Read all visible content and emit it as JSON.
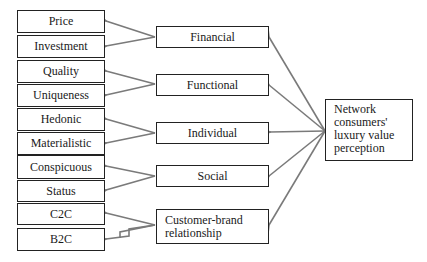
{
  "diagram": {
    "root": {
      "label": "Network consumers' luxury value perception",
      "lines": [
        "Network",
        "consumers'",
        "luxury value",
        "perception"
      ]
    },
    "dimensions": [
      {
        "label": "Financial",
        "children": [
          "Price",
          "Investment"
        ]
      },
      {
        "label": "Functional",
        "children": [
          "Quality",
          "Uniqueness"
        ]
      },
      {
        "label": "Individual",
        "children": [
          "Hedonic",
          "Materialistic"
        ]
      },
      {
        "label": "Social",
        "children": [
          "Conspicuous",
          "Status"
        ]
      },
      {
        "label": "Customer-brand relationship",
        "lines": [
          "Customer-brand",
          "relationship"
        ],
        "children": [
          "C2C",
          "B2C"
        ]
      }
    ],
    "leaves": [
      "Price",
      "Investment",
      "Quality",
      "Uniqueness",
      "Hedonic",
      "Materialistic",
      "Conspicuous",
      "Status",
      "C2C",
      "B2C"
    ]
  },
  "colors": {
    "arrow": "#7a7a7a",
    "border": "#222222",
    "text": "#1a1a1a"
  }
}
